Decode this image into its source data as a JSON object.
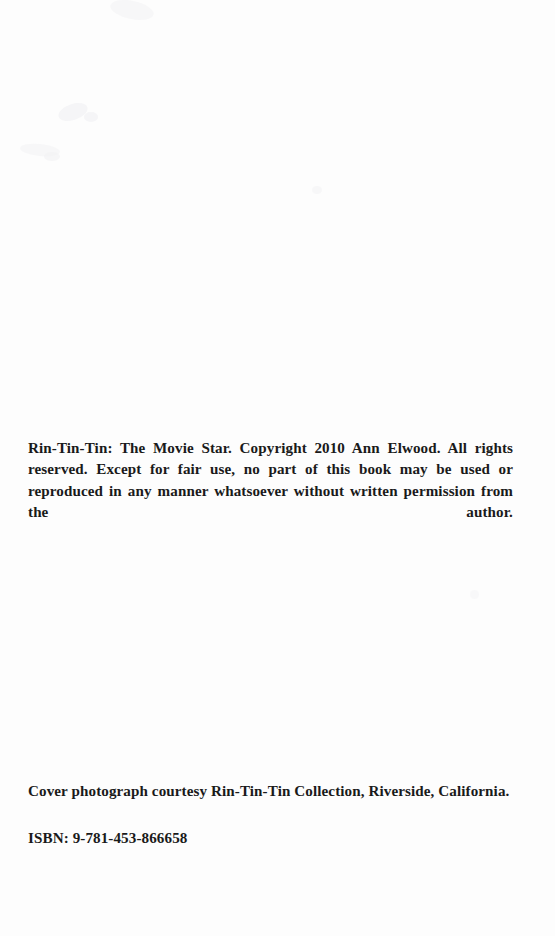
{
  "page": {
    "type": "book-copyright-page",
    "background_color": "#fdfdfd",
    "text_color": "#1a1a1a"
  },
  "copyright": {
    "paragraph": "Rin-Tin-Tin: The Movie Star.  Copyright 2010 Ann Elwood. All rights reserved. Except for fair use, no part of this book may be used or reproduced in any manner whatsoever without written permission from the author."
  },
  "credits": {
    "cover_photograph": "Cover photograph courtesy Rin-Tin-Tin Collection, Riverside, California."
  },
  "identifiers": {
    "isbn": "ISBN: 9-781-453-866658"
  }
}
